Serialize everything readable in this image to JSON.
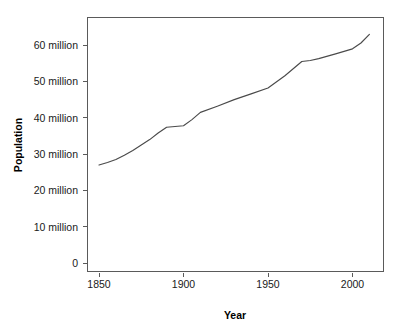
{
  "chart_data": {
    "type": "line",
    "title": "",
    "subtitle": "",
    "xlabel": "Year",
    "ylabel": "Population",
    "xlim": [
      1844,
      2020
    ],
    "ylim": [
      0,
      68
    ],
    "grid": false,
    "legend": null,
    "x_ticks": [
      1850,
      1900,
      1950,
      2000
    ],
    "x_tick_labels": [
      "1850",
      "1900",
      "1950",
      "2000"
    ],
    "y_ticks": [
      0,
      10,
      20,
      30,
      40,
      50,
      60
    ],
    "y_tick_labels": [
      "0",
      "10 million",
      "20 million",
      "30 million",
      "40 million",
      "50 million",
      "60 million"
    ],
    "y_unit": "million",
    "series": [
      {
        "name": "Population",
        "color": "#4a4a4a",
        "x": [
          1850,
          1855,
          1860,
          1865,
          1870,
          1875,
          1880,
          1885,
          1890,
          1895,
          1900,
          1905,
          1910,
          1920,
          1930,
          1940,
          1950,
          1960,
          1970,
          1975,
          1980,
          1990,
          2000,
          2005,
          2010
        ],
        "values": [
          27.0,
          27.7,
          28.5,
          29.7,
          31.0,
          32.5,
          34.0,
          35.8,
          37.4,
          37.6,
          37.8,
          39.5,
          41.5,
          43.2,
          45.0,
          46.6,
          48.2,
          51.6,
          55.5,
          55.8,
          56.3,
          57.6,
          59.0,
          60.6,
          63.0
        ]
      }
    ],
    "annotations": []
  },
  "axes": {
    "x_axis_label": "Year",
    "y_axis_label": "Population"
  },
  "geometry": {
    "plot_left": 87,
    "plot_right": 384,
    "plot_top": 17,
    "plot_bottom": 272,
    "x_px_1850": 99,
    "x_px_per_50yr": 84.5,
    "y_px_zero": 263,
    "y_px_per_10m": 36.3
  },
  "colors": {
    "background": "#ffffff",
    "frame": "#5a5a5a",
    "line": "#4a4a4a",
    "text": "#1a1a1a"
  }
}
